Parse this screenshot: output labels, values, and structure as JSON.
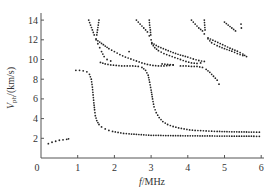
{
  "chart_data": {
    "type": "scatter",
    "title": "",
    "xlabel": "f/MHz",
    "ylabel": "V_ph/(km/s)",
    "xlim": [
      0,
      6
    ],
    "ylim": [
      0,
      14
    ],
    "xticks": [
      0,
      1,
      2,
      3,
      4,
      5,
      6
    ],
    "yticks": [
      2,
      4,
      6,
      8,
      10,
      12,
      14
    ],
    "grid": false,
    "legend": null,
    "series": [
      {
        "name": "mode-A0-low",
        "points": [
          [
            0.2,
            1.45
          ],
          [
            0.3,
            1.6
          ],
          [
            0.4,
            1.7
          ],
          [
            0.5,
            1.8
          ],
          [
            0.6,
            1.85
          ],
          [
            0.7,
            1.9
          ],
          [
            0.75,
            1.95
          ]
        ]
      },
      {
        "name": "mode-1",
        "points": [
          [
            0.95,
            8.9
          ],
          [
            1.05,
            8.9
          ],
          [
            1.15,
            8.85
          ],
          [
            1.25,
            8.75
          ],
          [
            1.32,
            8.5
          ],
          [
            1.37,
            8.0
          ],
          [
            1.4,
            7.2
          ],
          [
            1.42,
            6.4
          ],
          [
            1.44,
            5.6
          ],
          [
            1.46,
            4.9
          ],
          [
            1.48,
            4.3
          ],
          [
            1.52,
            3.8
          ],
          [
            1.58,
            3.4
          ],
          [
            1.65,
            3.15
          ],
          [
            1.75,
            2.95
          ],
          [
            1.85,
            2.8
          ],
          [
            1.95,
            2.7
          ],
          [
            2.1,
            2.6
          ],
          [
            2.25,
            2.5
          ],
          [
            2.4,
            2.45
          ],
          [
            2.6,
            2.4
          ],
          [
            2.8,
            2.35
          ],
          [
            3.0,
            2.3
          ],
          [
            3.2,
            2.3
          ],
          [
            3.4,
            2.28
          ],
          [
            3.6,
            2.27
          ],
          [
            3.8,
            2.26
          ],
          [
            4.0,
            2.25
          ],
          [
            4.2,
            2.25
          ],
          [
            4.4,
            2.24
          ],
          [
            4.6,
            2.24
          ],
          [
            4.8,
            2.23
          ],
          [
            5.0,
            2.23
          ],
          [
            5.2,
            2.22
          ],
          [
            5.4,
            2.22
          ],
          [
            5.6,
            2.22
          ],
          [
            5.8,
            2.21
          ],
          [
            5.95,
            2.2
          ]
        ]
      },
      {
        "name": "mode-2",
        "points": [
          [
            1.62,
            9.7
          ],
          [
            1.75,
            9.55
          ],
          [
            1.9,
            9.45
          ],
          [
            2.05,
            9.4
          ],
          [
            2.2,
            9.35
          ],
          [
            2.35,
            9.35
          ],
          [
            2.5,
            9.35
          ],
          [
            2.65,
            9.3
          ],
          [
            2.75,
            9.2
          ],
          [
            2.85,
            8.9
          ],
          [
            2.92,
            8.4
          ],
          [
            2.96,
            7.7
          ],
          [
            3.0,
            6.9
          ],
          [
            3.04,
            6.0
          ],
          [
            3.08,
            5.2
          ],
          [
            3.14,
            4.6
          ],
          [
            3.22,
            4.1
          ],
          [
            3.32,
            3.7
          ],
          [
            3.45,
            3.4
          ],
          [
            3.6,
            3.2
          ],
          [
            3.75,
            3.05
          ],
          [
            3.9,
            2.95
          ],
          [
            4.05,
            2.85
          ],
          [
            4.2,
            2.8
          ],
          [
            4.35,
            2.78
          ],
          [
            4.5,
            2.75
          ],
          [
            4.65,
            2.72
          ],
          [
            4.8,
            2.7
          ],
          [
            5.0,
            2.68
          ],
          [
            5.2,
            2.66
          ],
          [
            5.4,
            2.65
          ],
          [
            5.6,
            2.64
          ],
          [
            5.8,
            2.63
          ],
          [
            5.95,
            2.62
          ]
        ]
      },
      {
        "name": "mode-3",
        "points": [
          [
            1.5,
            12.0
          ],
          [
            1.55,
            11.6
          ],
          [
            1.6,
            11.2
          ],
          [
            1.65,
            10.8
          ],
          [
            1.72,
            10.3
          ],
          [
            1.8,
            10.0
          ],
          [
            1.9,
            9.85
          ]
        ]
      },
      {
        "name": "mode-3b",
        "points": [
          [
            1.55,
            11.9
          ],
          [
            1.7,
            11.5
          ],
          [
            1.85,
            11.1
          ],
          [
            2.0,
            10.8
          ],
          [
            2.15,
            10.5
          ],
          [
            2.3,
            10.25
          ],
          [
            2.45,
            10.05
          ],
          [
            2.6,
            9.85
          ],
          [
            2.75,
            9.65
          ],
          [
            2.9,
            9.5
          ],
          [
            3.05,
            9.4
          ],
          [
            3.2,
            9.35
          ],
          [
            3.35,
            9.35
          ],
          [
            3.5,
            9.4
          ],
          [
            3.6,
            9.45
          ]
        ]
      },
      {
        "name": "mode-4",
        "points": [
          [
            3.8,
            9.35
          ],
          [
            3.95,
            9.35
          ],
          [
            4.1,
            9.3
          ],
          [
            4.25,
            9.3
          ],
          [
            4.4,
            9.2
          ],
          [
            4.5,
            9.0
          ],
          [
            4.6,
            8.7
          ],
          [
            4.7,
            8.3
          ],
          [
            4.8,
            7.9
          ],
          [
            4.85,
            7.5
          ]
        ]
      },
      {
        "name": "mode-4b",
        "points": [
          [
            3.6,
            9.45
          ],
          [
            3.45,
            9.5
          ],
          [
            3.3,
            9.55
          ]
        ]
      },
      {
        "name": "mode-5",
        "points": [
          [
            1.3,
            14.0
          ],
          [
            1.35,
            13.5
          ],
          [
            1.4,
            13.0
          ],
          [
            1.45,
            12.5
          ],
          [
            1.5,
            12.1
          ]
        ]
      },
      {
        "name": "mode-5b",
        "points": [
          [
            1.58,
            14.0
          ],
          [
            1.56,
            13.5
          ],
          [
            1.54,
            13.0
          ],
          [
            1.52,
            12.5
          ]
        ]
      },
      {
        "name": "mode-6",
        "points": [
          [
            2.6,
            14.0
          ],
          [
            2.7,
            13.6
          ],
          [
            2.8,
            13.2
          ],
          [
            2.9,
            12.8
          ],
          [
            2.95,
            12.4
          ],
          [
            3.0,
            12.0
          ]
        ]
      },
      {
        "name": "mode-6b",
        "points": [
          [
            2.95,
            14.0
          ],
          [
            2.96,
            13.5
          ],
          [
            2.98,
            13.0
          ],
          [
            2.99,
            12.5
          ]
        ]
      },
      {
        "name": "mode-7",
        "points": [
          [
            3.02,
            11.7
          ],
          [
            3.2,
            11.3
          ],
          [
            3.4,
            11.0
          ],
          [
            3.6,
            10.7
          ],
          [
            3.8,
            10.45
          ],
          [
            4.0,
            10.25
          ],
          [
            4.15,
            10.05
          ],
          [
            4.3,
            9.9
          ],
          [
            4.45,
            9.8
          ]
        ]
      },
      {
        "name": "mode-7b",
        "points": [
          [
            3.02,
            11.6
          ],
          [
            3.1,
            11.2
          ],
          [
            3.2,
            10.9
          ],
          [
            3.35,
            10.6
          ],
          [
            3.5,
            10.4
          ],
          [
            3.65,
            10.2
          ],
          [
            3.8,
            10.0
          ],
          [
            3.95,
            9.8
          ],
          [
            4.1,
            9.65
          ],
          [
            4.25,
            9.6
          ],
          [
            4.35,
            9.65
          ]
        ]
      },
      {
        "name": "mode-8",
        "points": [
          [
            4.1,
            14.0
          ],
          [
            4.2,
            13.6
          ],
          [
            4.3,
            13.2
          ],
          [
            4.4,
            12.9
          ],
          [
            4.45,
            12.6
          ]
        ]
      },
      {
        "name": "mode-8b",
        "points": [
          [
            4.45,
            14.0
          ],
          [
            4.46,
            13.5
          ],
          [
            4.47,
            13.0
          ]
        ]
      },
      {
        "name": "mode-9",
        "points": [
          [
            4.55,
            12.2
          ],
          [
            4.75,
            11.85
          ],
          [
            4.95,
            11.5
          ],
          [
            5.15,
            11.15
          ],
          [
            5.35,
            10.85
          ],
          [
            5.5,
            10.55
          ],
          [
            5.6,
            10.3
          ]
        ]
      },
      {
        "name": "mode-9b",
        "points": [
          [
            4.55,
            12.1
          ],
          [
            4.65,
            11.7
          ],
          [
            4.8,
            11.4
          ],
          [
            5.0,
            11.1
          ],
          [
            5.2,
            10.85
          ],
          [
            5.35,
            10.6
          ],
          [
            5.5,
            10.4
          ]
        ]
      },
      {
        "name": "mode-10",
        "points": [
          [
            5.0,
            13.8
          ],
          [
            5.1,
            13.5
          ],
          [
            5.2,
            13.2
          ],
          [
            5.3,
            12.9
          ]
        ]
      },
      {
        "name": "mode-10b",
        "points": [
          [
            5.45,
            13.6
          ],
          [
            5.46,
            13.2
          ]
        ]
      },
      {
        "name": "stray",
        "points": [
          [
            2.4,
            10.8
          ]
        ]
      }
    ]
  },
  "axes": {
    "xlabel": "f/MHz",
    "ylabel_main": "V",
    "ylabel_sub": "ph",
    "ylabel_unit": "/(km/s)"
  }
}
